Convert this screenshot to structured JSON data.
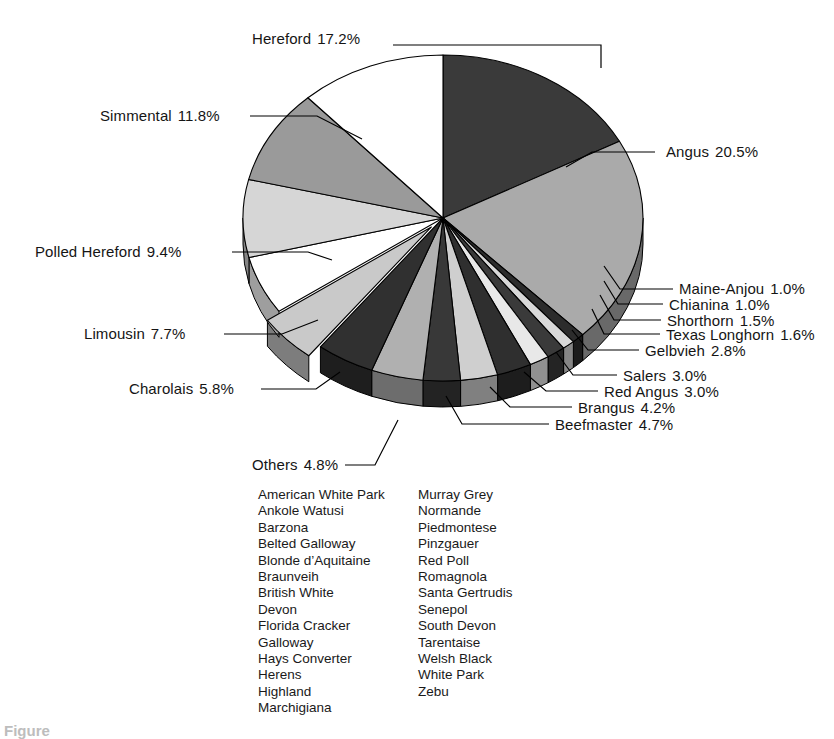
{
  "figure": {
    "caption": "Figure",
    "others_group_label": "Others",
    "others_group_pct": "4.8%"
  },
  "chart_data": {
    "type": "pie",
    "title": "",
    "units": "percent",
    "legend": "callout-labels",
    "start_angle_deg": 0,
    "direction": "clockwise",
    "exploded_slices": [
      "Others"
    ],
    "categories": [
      "Hereford",
      "Angus",
      "Maine-Anjou",
      "Chianina",
      "Shorthorn",
      "Texas Longhorn",
      "Gelbvieh",
      "Salers",
      "Red Angus",
      "Brangus",
      "Beefmaster",
      "Others",
      "Charolais",
      "Limousin",
      "Polled Hereford",
      "Simmental"
    ],
    "values": [
      17.2,
      20.5,
      1.0,
      1.0,
      1.5,
      1.6,
      2.8,
      3.0,
      3.0,
      4.2,
      4.7,
      4.8,
      5.8,
      7.7,
      9.4,
      11.8
    ],
    "slice_fills": [
      "#3a3a3a",
      "#aaaaaa",
      "#2c2c2c",
      "#d8d8d8",
      "#3a3a3a",
      "#e8e8e8",
      "#2f2f2f",
      "#cfcfcf",
      "#383838",
      "#b0b0b0",
      "#303030",
      "#c9c9c9",
      "#ffffff",
      "#d6d6d6",
      "#9a9a9a",
      "#ffffff"
    ],
    "labels": [
      {
        "name": "Hereford",
        "pct": "17.2%"
      },
      {
        "name": "Angus",
        "pct": "20.5%"
      },
      {
        "name": "Maine-Anjou",
        "pct": "1.0%"
      },
      {
        "name": "Chianina",
        "pct": "1.0%"
      },
      {
        "name": "Shorthorn",
        "pct": "1.5%"
      },
      {
        "name": "Texas Longhorn",
        "pct": "1.6%"
      },
      {
        "name": "Gelbvieh",
        "pct": "2.8%"
      },
      {
        "name": "Salers",
        "pct": "3.0%"
      },
      {
        "name": "Red Angus",
        "pct": "3.0%"
      },
      {
        "name": "Brangus",
        "pct": "4.2%"
      },
      {
        "name": "Beefmaster",
        "pct": "4.7%"
      },
      {
        "name": "Others",
        "pct": "4.8%"
      },
      {
        "name": "Charolais",
        "pct": "5.8%"
      },
      {
        "name": "Limousin",
        "pct": "7.7%"
      },
      {
        "name": "Polled Hereford",
        "pct": "9.4%"
      },
      {
        "name": "Simmental",
        "pct": "11.8%"
      }
    ]
  },
  "callouts": {
    "hereford": {
      "name": "Hereford",
      "pct": "17.2%"
    },
    "simmental": {
      "name": "Simmental",
      "pct": "11.8%"
    },
    "angus": {
      "name": "Angus",
      "pct": "20.5%"
    },
    "polled_hereford": {
      "name": "Polled Hereford",
      "pct": "9.4%"
    },
    "limousin": {
      "name": "Limousin",
      "pct": "7.7%"
    },
    "charolais": {
      "name": "Charolais",
      "pct": "5.8%"
    },
    "others": {
      "name": "Others",
      "pct": "4.8%"
    },
    "maine_anjou": {
      "name": "Maine-Anjou",
      "pct": "1.0%"
    },
    "chianina": {
      "name": "Chianina",
      "pct": "1.0%"
    },
    "shorthorn": {
      "name": "Shorthorn",
      "pct": "1.5%"
    },
    "texas_longhorn": {
      "name": "Texas Longhorn",
      "pct": "1.6%"
    },
    "gelbvieh": {
      "name": "Gelbvieh",
      "pct": "2.8%"
    },
    "salers": {
      "name": "Salers",
      "pct": "3.0%"
    },
    "red_angus": {
      "name": "Red Angus",
      "pct": "3.0%"
    },
    "brangus": {
      "name": "Brangus",
      "pct": "4.2%"
    },
    "beefmaster": {
      "name": "Beefmaster",
      "pct": "4.7%"
    }
  },
  "others_breeds": {
    "column_left": [
      "American White Park",
      "Ankole Watusi",
      "Barzona",
      "Belted Galloway",
      "Blonde d’Aquitaine",
      "Braunveih",
      "British White",
      "Devon",
      "Florida Cracker",
      "Galloway",
      "Hays Converter",
      "Herens",
      "Highland",
      "Marchigiana"
    ],
    "column_right": [
      "Murray Grey",
      "Normande",
      "Piedmontese",
      "Pinzgauer",
      "Red Poll",
      "Romagnola",
      "Santa Gertrudis",
      "Senepol",
      "South Devon",
      "Tarentaise",
      "Welsh Black",
      "White Park",
      "Zebu"
    ]
  },
  "colors": {
    "background": "#ffffff",
    "text": "#151515",
    "outline": "#000000",
    "dark_slice": "#3a3a3a",
    "mid_slice": "#aaaaaa",
    "light_slice": "#e0e0e0"
  }
}
